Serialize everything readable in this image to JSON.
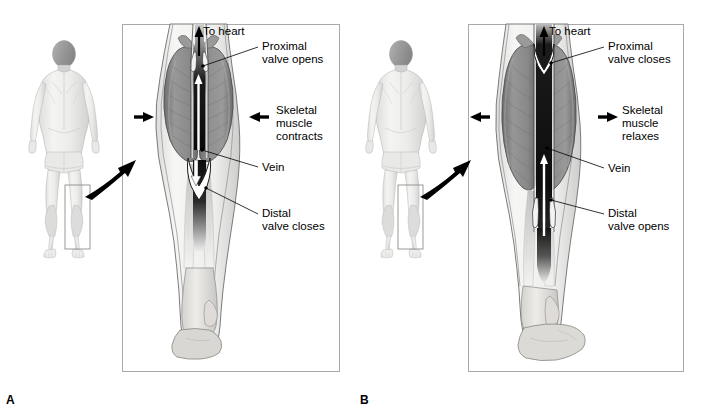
{
  "figure": {
    "type": "anatomical-diagram",
    "style": "grayscale medical illustration",
    "background_color": "#ffffff",
    "frame_border_color": "#a9a9ac"
  },
  "panels": [
    {
      "letter": "A",
      "state": "contracted",
      "body_figure": {
        "view": "posterior whole body",
        "highlight_box_label": "lower leg region"
      },
      "labels": {
        "to_heart": "To heart",
        "proximal_valve": "Proximal\nvalve opens",
        "skeletal_muscle": "Skeletal\nmuscle\ncontracts",
        "vein": "Vein",
        "distal_valve": "Distal\nvalve closes"
      },
      "arrows": {
        "left_compression_direction": "right",
        "right_compression_direction": "left",
        "blood_flow_direction": "up-to-heart",
        "distal_flow_direction": "down-blocked"
      }
    },
    {
      "letter": "B",
      "state": "relaxed",
      "body_figure": {
        "view": "posterior whole body",
        "highlight_box_label": "lower leg region"
      },
      "labels": {
        "to_heart": "To heart",
        "proximal_valve": "Proximal\nvalve closes",
        "skeletal_muscle": "Skeletal\nmuscle\nrelaxes",
        "vein": "Vein",
        "distal_valve": "Distal\nvalve opens"
      },
      "arrows": {
        "left_compression_direction": "left",
        "right_compression_direction": "right",
        "blood_flow_direction": "up-to-heart",
        "distal_flow_direction": "up-entering"
      }
    }
  ],
  "colors": {
    "muscle_fill": "#8d8d8d",
    "muscle_fill_light": "#a6a6a6",
    "skin_fill": "#f2f2f0",
    "bone_fill": "#e0dedb",
    "vein_dark": "#121212",
    "outline": "#4a4a4a",
    "arrow_black": "#000000",
    "arrow_white": "#ffffff",
    "body_fill": "#f0f0ee",
    "body_shade": "#cfcfcd",
    "head_fill": "#9d9d9d"
  }
}
